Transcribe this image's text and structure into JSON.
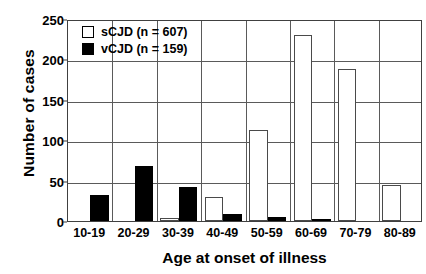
{
  "chart_data": {
    "type": "bar",
    "title": "",
    "xlabel": "Age at onset of illness",
    "ylabel": "Number of cases",
    "categories": [
      "10-19",
      "20-29",
      "30-39",
      "40-49",
      "50-59",
      "60-69",
      "70-79",
      "80-89"
    ],
    "series": [
      {
        "name": "sCJD (n = 607)",
        "short_name": "sCJD",
        "count": 607,
        "style": "open",
        "color": "#ffffff",
        "edge_color": "#4a4a4a",
        "values": [
          0,
          0,
          4,
          30,
          113,
          230,
          188,
          44
        ]
      },
      {
        "name": "vCJD (n = 159)",
        "short_name": "vCJD",
        "count": 159,
        "style": "filled",
        "color": "#000000",
        "edge_color": "#000000",
        "values": [
          32,
          68,
          42,
          9,
          5,
          2,
          0,
          0
        ]
      }
    ],
    "ylim": [
      0,
      250
    ],
    "yticks": [
      0,
      50,
      100,
      150,
      200,
      250
    ],
    "grid": "horizontal",
    "legend_position": "top-left-inside",
    "axis_color": "#404040"
  }
}
